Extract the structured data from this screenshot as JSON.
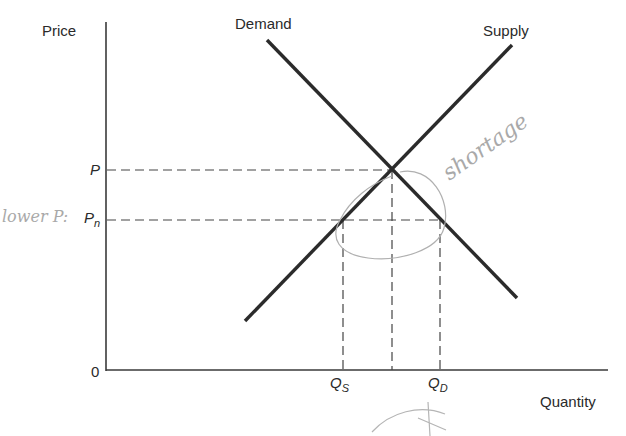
{
  "diagram": {
    "axes": {
      "y_label": "Price",
      "x_label": "Quantity",
      "origin_label": "0"
    },
    "curves": [
      {
        "name": "Demand",
        "label": "Demand",
        "slope": "downward"
      },
      {
        "name": "Supply",
        "label": "Supply",
        "slope": "upward"
      }
    ],
    "price_labels": {
      "equilibrium": "P",
      "lower_main": "P",
      "lower_sub": "n"
    },
    "quantity_labels": {
      "supplied_main": "Q",
      "supplied_sub": "S",
      "demanded_main": "Q",
      "demanded_sub": "D"
    },
    "annotations": {
      "handwritten_left": "lower P:",
      "handwritten_right": "shortage",
      "handwritten_mark": "✗"
    },
    "colors": {
      "line": "#2b2b2b",
      "axis": "#3a3a3a",
      "dashed": "#444444",
      "handwriting": "#aaaaaa"
    }
  }
}
